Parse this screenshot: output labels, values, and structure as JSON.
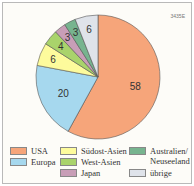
{
  "code": "3435E",
  "chart_data": {
    "type": "pie",
    "title": "",
    "unit": "%",
    "categories": [
      "USA",
      "Europa",
      "Südost-Asien",
      "West-Asien",
      "Japan",
      "Australien/ Neuseeland",
      "übrige"
    ],
    "values": [
      58,
      20,
      6,
      4,
      3,
      3,
      6
    ],
    "colors": [
      "#f6a57a",
      "#a6d8ee",
      "#fdfb9c",
      "#a9d36b",
      "#c89eb7",
      "#77b48f",
      "#dfe3ea"
    ],
    "legend_position": "bottom"
  },
  "legend": [
    {
      "label": "USA",
      "color": "#f6a57a"
    },
    {
      "label": "Europa",
      "color": "#a6d8ee"
    },
    {
      "label": "Südost-Asien",
      "color": "#fdfb9c"
    },
    {
      "label": "West-Asien",
      "color": "#a9d36b"
    },
    {
      "label": "Japan",
      "color": "#c89eb7"
    },
    {
      "label": "Australien/\nNeuseeland",
      "color": "#77b48f"
    },
    {
      "label": "übrige",
      "color": "#dfe3ea"
    }
  ]
}
